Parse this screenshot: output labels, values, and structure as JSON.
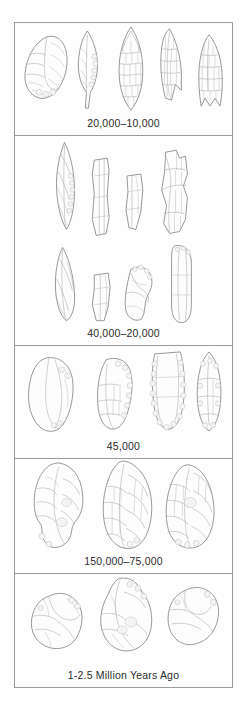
{
  "figure": {
    "border_color": "#9a9a9a",
    "background_color": "#ffffff",
    "ink_color": "#8c8c8c",
    "panel_count": 5
  },
  "panels": [
    {
      "id": "panel-20000-10000",
      "caption": "20,000–10,000",
      "artifact_count": 5,
      "artifact_names": [
        "retouched-flake-scraper",
        "leaf-point-bifacial",
        "laurel-leaf-biface",
        "shouldered-point",
        "fishtail-stemmed-point"
      ]
    },
    {
      "id": "panel-40000-20000",
      "caption": "40,000–20,000",
      "artifact_count": 8,
      "artifact_names": [
        "backed-blade",
        "prismatic-blade",
        "truncated-blade",
        "burin-core",
        "pointed-blade",
        "rectangular-blade-fragment",
        "notched-flake",
        "elongated-blade"
      ]
    },
    {
      "id": "panel-45000",
      "caption": "45,000",
      "artifact_count": 4,
      "artifact_names": [
        "levallois-flake",
        "side-scraper",
        "denticulate-flake",
        "mousterian-point"
      ]
    },
    {
      "id": "panel-150000-75000",
      "caption": "150,000–75,000",
      "artifact_count": 3,
      "artifact_names": [
        "acheulean-handaxe-tanged",
        "ovate-handaxe",
        "cordiform-handaxe"
      ]
    },
    {
      "id": "panel-1-2-5-million",
      "caption": "1-2.5 Million Years Ago",
      "artifact_count": 3,
      "artifact_names": [
        "oldowan-chopper-core",
        "oldowan-core-tool",
        "oldowan-cobble-core"
      ]
    }
  ]
}
